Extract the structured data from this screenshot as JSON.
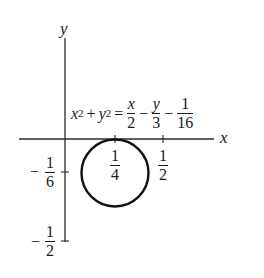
{
  "diagram": {
    "type": "circle-on-coordinate-axes",
    "axes": {
      "x_label": "x",
      "y_label": "y"
    },
    "equation": {
      "lhs_term1_base": "x",
      "lhs_term1_exp": "2",
      "plus": "+",
      "lhs_term2_base": "y",
      "lhs_term2_exp": "2",
      "equals": "=",
      "rhs_frac1_num": "x",
      "rhs_frac1_den": "2",
      "minus1": "−",
      "rhs_frac2_num": "y",
      "rhs_frac2_den": "3",
      "minus2": "−",
      "rhs_frac3_num": "1",
      "rhs_frac3_den": "16"
    },
    "x_ticks": [
      {
        "sign": "",
        "num": "1",
        "den": "4",
        "value": 0.25
      },
      {
        "sign": "",
        "num": "1",
        "den": "2",
        "value": 0.5
      }
    ],
    "y_ticks": [
      {
        "sign": "−",
        "num": "1",
        "den": "6",
        "value": -0.1667
      },
      {
        "sign": "−",
        "num": "1",
        "den": "2",
        "value": -0.5
      }
    ],
    "circle": {
      "center_x": "1/4",
      "center_y": "-1/6",
      "stroke_color": "#111111"
    },
    "colors": {
      "ink": "#1a1a1a",
      "background": "#ffffff"
    }
  }
}
